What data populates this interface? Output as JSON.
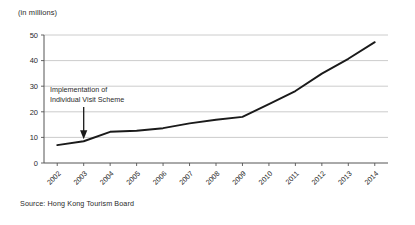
{
  "unit_label": "(in millions)",
  "source_note": "Source:  Hong Kong Tourism Board",
  "annotation": {
    "line1": "Implementation of",
    "line2": "Individual Visit Scheme",
    "target_year": "2003"
  },
  "colors": {
    "line": "#1a1a1a",
    "grid": "#bfbfbf",
    "axis": "#555555",
    "text": "#2a2a2a",
    "background": "#ffffff"
  },
  "chart_data": {
    "type": "line",
    "title": "",
    "subtitle": "",
    "xlabel": "",
    "ylabel": "(in millions)",
    "categories": [
      "2002",
      "2003",
      "2004",
      "2005",
      "2006",
      "2007",
      "2008",
      "2009",
      "2010",
      "2011",
      "2012",
      "2013",
      "2014"
    ],
    "values": [
      7,
      8.5,
      12.2,
      12.6,
      13.6,
      15.5,
      16.9,
      18,
      23,
      28.1,
      34.9,
      40.7,
      47.2
    ],
    "series": [
      {
        "name": "Mainland visitor arrivals",
        "values": [
          7,
          8.5,
          12.2,
          12.6,
          13.6,
          15.5,
          16.9,
          18,
          23,
          28.1,
          34.9,
          40.7,
          47.2
        ]
      }
    ],
    "ylim": [
      0,
      50
    ],
    "yticks": [
      0,
      10,
      20,
      30,
      40,
      50
    ],
    "ytick_labels": [
      "0",
      "10",
      "20",
      "30",
      "40",
      "50"
    ],
    "grid": true,
    "grid_axis": "y",
    "legend": false,
    "legend_position": "none",
    "xtick_rotation": -45,
    "annotations": [
      {
        "text": "Implementation of Individual Visit Scheme",
        "at_category": "2003",
        "arrow": "down"
      }
    ]
  }
}
